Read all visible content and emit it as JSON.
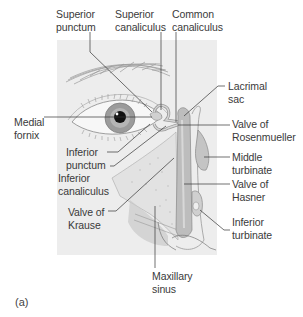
{
  "figure": {
    "caption": "(a)",
    "panel_color": "#ededed",
    "labels": [
      {
        "id": "superior-punctum",
        "text": "Superior\npunctum"
      },
      {
        "id": "superior-canaliculus",
        "text": "Superior\ncanaliculus"
      },
      {
        "id": "common-canaliculus",
        "text": "Common\ncanaliculus"
      },
      {
        "id": "lacrimal-sac",
        "text": "Lacrimal\nsac"
      },
      {
        "id": "medial-fornix",
        "text": "Medial\nfornix"
      },
      {
        "id": "valve-of-rosenmueller",
        "text": "Valve of\nRosenmueller"
      },
      {
        "id": "middle-turbinate",
        "text": "Middle\nturbinate"
      },
      {
        "id": "inferior-punctum",
        "text": "Inferior\npunctum"
      },
      {
        "id": "inferior-canaliculus",
        "text": "Inferior\ncanaliculus"
      },
      {
        "id": "valve-of-hasner",
        "text": "Valve of\nHasner"
      },
      {
        "id": "valve-of-krause",
        "text": "Valve of\nKrause"
      },
      {
        "id": "inferior-turbinate",
        "text": "Inferior\nturbinate"
      },
      {
        "id": "maxillary-sinus",
        "text": "Maxillary\nsinus"
      }
    ]
  }
}
